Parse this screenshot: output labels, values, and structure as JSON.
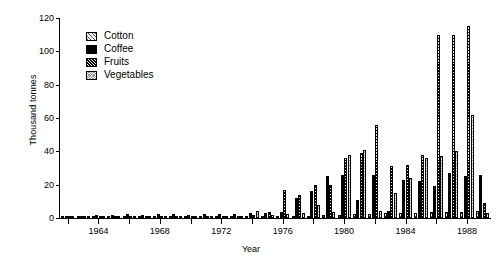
{
  "chart_data": {
    "type": "bar",
    "title": "",
    "xlabel": "Year",
    "ylabel": "Thousand tonnes",
    "ylim": [
      0,
      120
    ],
    "yticks": [
      0,
      20,
      40,
      60,
      80,
      100,
      120
    ],
    "xticks": [
      1964,
      1968,
      1972,
      1976,
      1980,
      1984,
      1988
    ],
    "xlim": [
      1961.5,
      1989.5
    ],
    "grid": false,
    "legend_position": "upper-left-inside",
    "categories": [
      1962,
      1963,
      1964,
      1965,
      1966,
      1967,
      1968,
      1969,
      1970,
      1971,
      1972,
      1973,
      1974,
      1975,
      1976,
      1977,
      1978,
      1979,
      1980,
      1981,
      1982,
      1983,
      1984,
      1985,
      1986,
      1987,
      1988,
      1989
    ],
    "series": [
      {
        "name": "Cotton",
        "pattern": "light-diagonal-hatch",
        "values": [
          0.2,
          0.2,
          0.2,
          0.3,
          0.3,
          0.3,
          0.4,
          0.4,
          0.4,
          0.5,
          0.5,
          0.5,
          0.6,
          0.8,
          1.0,
          1.2,
          1.5,
          1.8,
          2.0,
          2.2,
          2.5,
          2.8,
          3.0,
          3.2,
          3.4,
          3.6,
          3.8,
          4.0
        ]
      },
      {
        "name": "Coffee",
        "pattern": "solid-black",
        "values": [
          1.2,
          1.5,
          1.8,
          2.0,
          2.2,
          2.0,
          2.4,
          2.2,
          2.0,
          2.3,
          2.6,
          2.4,
          2.8,
          3.0,
          3.5,
          12.0,
          16.0,
          25.0,
          26.0,
          11.0,
          26.0,
          4.5,
          23.0,
          22.0,
          19.0,
          27.0,
          25.0,
          26.0
        ]
      },
      {
        "name": "Fruits",
        "pattern": "dense-dark-hatch",
        "values": [
          0.5,
          0.6,
          0.6,
          0.8,
          0.8,
          0.9,
          1.0,
          1.0,
          1.1,
          1.2,
          1.3,
          1.4,
          2.0,
          3.5,
          17.0,
          14.0,
          20.0,
          20.0,
          36.0,
          39.0,
          56.0,
          31.0,
          32.0,
          38.0,
          110.0,
          110.0,
          115.0,
          9.0
        ]
      },
      {
        "name": "Vegetables",
        "pattern": "light-dotted-checker",
        "values": [
          0.3,
          0.3,
          0.4,
          0.4,
          0.5,
          0.5,
          0.6,
          0.6,
          0.7,
          0.7,
          0.8,
          1.0,
          4.0,
          2.0,
          2.5,
          3.0,
          8.0,
          3.5,
          38.0,
          41.0,
          4.0,
          15.0,
          24.0,
          36.0,
          37.0,
          40.0,
          62.0,
          3.0
        ]
      }
    ]
  },
  "legend": {
    "items": [
      {
        "label": "Cotton"
      },
      {
        "label": "Coffee"
      },
      {
        "label": "Fruits"
      },
      {
        "label": "Vegetables"
      }
    ]
  }
}
